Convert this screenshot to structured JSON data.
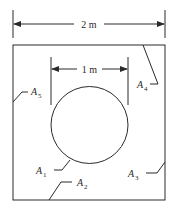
{
  "diagram": {
    "dimensions": {
      "outer_width_label": "2 m",
      "circle_diameter_label": "1 m"
    },
    "surfaces": [
      {
        "letter": "A",
        "sub": "1",
        "refers_to": "circle"
      },
      {
        "letter": "A",
        "sub": "2",
        "refers_to": "bottom edge"
      },
      {
        "letter": "A",
        "sub": "3",
        "refers_to": "right edge"
      },
      {
        "letter": "A",
        "sub": "4",
        "refers_to": "top-right corner"
      },
      {
        "letter": "A",
        "sub": "5",
        "refers_to": "left edge"
      }
    ],
    "colors": {
      "line": "#2a2a2a",
      "background": "#ffffff"
    }
  }
}
